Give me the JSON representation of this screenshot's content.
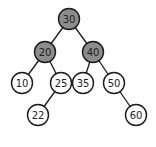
{
  "diagram": {
    "type": "binary-search-tree",
    "colors": {
      "highlighted_fill": "#8c8c8c",
      "normal_fill": "#ffffff",
      "stroke": "#1a1a1a",
      "edge": "#1a1a1a"
    },
    "nodes": [
      {
        "id": "n30",
        "label": "30",
        "x": 69,
        "y": 19,
        "highlighted": true
      },
      {
        "id": "n20",
        "label": "20",
        "x": 45,
        "y": 52,
        "highlighted": true
      },
      {
        "id": "n40",
        "label": "40",
        "x": 93,
        "y": 52,
        "highlighted": true
      },
      {
        "id": "n10",
        "label": "10",
        "x": 22,
        "y": 83,
        "highlighted": false
      },
      {
        "id": "n25",
        "label": "25",
        "x": 61,
        "y": 83,
        "highlighted": false
      },
      {
        "id": "n35",
        "label": "35",
        "x": 83,
        "y": 83,
        "highlighted": false
      },
      {
        "id": "n50",
        "label": "50",
        "x": 114,
        "y": 83,
        "highlighted": false
      },
      {
        "id": "n22",
        "label": "22",
        "x": 38,
        "y": 115,
        "highlighted": false
      },
      {
        "id": "n60",
        "label": "60",
        "x": 136,
        "y": 115,
        "highlighted": false
      }
    ],
    "edges": [
      [
        "n30",
        "n20"
      ],
      [
        "n30",
        "n40"
      ],
      [
        "n20",
        "n10"
      ],
      [
        "n20",
        "n25"
      ],
      [
        "n40",
        "n35"
      ],
      [
        "n40",
        "n50"
      ],
      [
        "n25",
        "n22"
      ],
      [
        "n50",
        "n60"
      ]
    ],
    "node_radius": 10.5
  }
}
